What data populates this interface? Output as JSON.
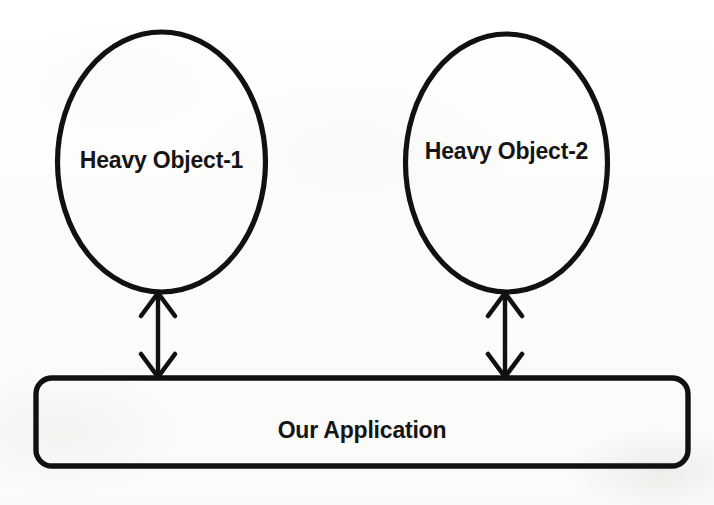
{
  "diagram": {
    "background_color": "#fdfdfc",
    "stroke_color": "#111111",
    "text_color": "#151515",
    "nodes": [
      {
        "id": "heavy-object-1",
        "shape": "ellipse",
        "label": "Heavy Object-1",
        "cx": 161,
        "cy": 162,
        "rx": 104,
        "ry": 130
      },
      {
        "id": "heavy-object-2",
        "shape": "ellipse",
        "label": "Heavy Object-2",
        "cx": 506,
        "cy": 163,
        "rx": 101,
        "ry": 129
      },
      {
        "id": "our-application",
        "shape": "rounded-rectangle",
        "label": "Our Application",
        "x": 36,
        "y": 378,
        "width": 652,
        "height": 88,
        "corner_radius": 16
      }
    ],
    "connectors": [
      {
        "id": "connector-left",
        "from": "our-application",
        "to": "heavy-object-1",
        "direction": "bidirectional",
        "x": 158,
        "y_start": 292,
        "y_end": 378
      },
      {
        "id": "connector-right",
        "from": "our-application",
        "to": "heavy-object-2",
        "direction": "bidirectional",
        "x": 505,
        "y_start": 292,
        "y_end": 378
      }
    ]
  }
}
